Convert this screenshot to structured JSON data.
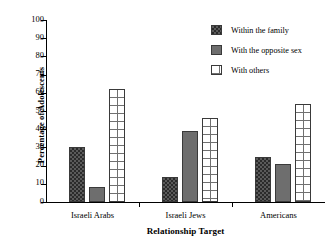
{
  "chart_data": {
    "type": "bar",
    "title": "",
    "xlabel": "Relationship Target",
    "ylabel": "Percentage of Adolescents",
    "categories": [
      "Israeli Arabs",
      "Israeli Jews",
      "Americans"
    ],
    "series": [
      {
        "name": "Within the family",
        "pattern": "checker-dark",
        "values": [
          30,
          14,
          25
        ]
      },
      {
        "name": "With the opposite sex",
        "pattern": "solid-gray",
        "values": [
          8,
          39,
          21
        ]
      },
      {
        "name": "With others",
        "pattern": "grid-white",
        "values": [
          62,
          46,
          54
        ]
      }
    ],
    "ylim": [
      0,
      100
    ],
    "yticks": [
      0,
      10,
      20,
      30,
      40,
      50,
      60,
      70,
      80,
      90,
      100
    ],
    "ytick_labels": [
      "0",
      "10",
      "20",
      "30",
      "40",
      "50",
      "60",
      "70",
      "80",
      "90",
      "100"
    ],
    "grid": false,
    "legend_position": "upper right",
    "colors": {
      "within_family": "#5a5a5a",
      "opposite_sex": "#6e6e6e",
      "with_others": "#ffffff",
      "axis": "#000000",
      "bar_outline": "#3a3a3a"
    }
  },
  "legend": {
    "items": [
      {
        "label": "Within the family"
      },
      {
        "label": "With the opposite sex"
      },
      {
        "label": "With others"
      }
    ]
  }
}
